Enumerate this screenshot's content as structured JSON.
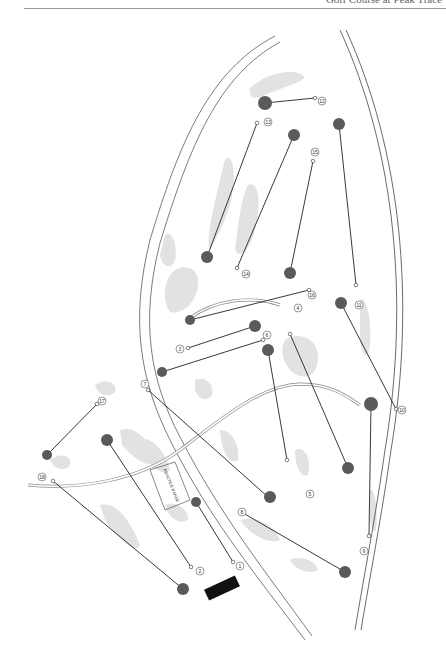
{
  "header": {
    "title": "Golf Course at Peak Trace"
  },
  "map": {
    "practice_range_label": "PRACTICE RANGE",
    "colors": {
      "rough": "#e0e0e0",
      "green": "#5a5a5a",
      "line": "#222222",
      "outline": "#888888",
      "building": "#111111"
    },
    "holes": [
      {
        "n": "1",
        "label": "1"
      },
      {
        "n": "2",
        "label": "2"
      },
      {
        "n": "3",
        "label": "3"
      },
      {
        "n": "4",
        "label": "4"
      },
      {
        "n": "5",
        "label": "5"
      },
      {
        "n": "6",
        "label": "6"
      },
      {
        "n": "7",
        "label": "7"
      },
      {
        "n": "8",
        "label": "8"
      },
      {
        "n": "9",
        "label": "9"
      },
      {
        "n": "10",
        "label": "10"
      },
      {
        "n": "11",
        "label": "11"
      },
      {
        "n": "12",
        "label": "12"
      },
      {
        "n": "13",
        "label": "13"
      },
      {
        "n": "14",
        "label": "14"
      },
      {
        "n": "15",
        "label": "15"
      },
      {
        "n": "16",
        "label": "16"
      },
      {
        "n": "17",
        "label": "17"
      },
      {
        "n": "18",
        "label": "18"
      }
    ]
  }
}
